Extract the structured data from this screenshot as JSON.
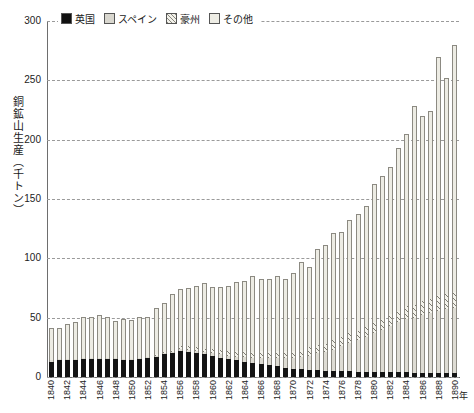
{
  "legend": {
    "items": [
      {
        "label": "英国",
        "key": "uk",
        "color": "#141414"
      },
      {
        "label": "スペイン",
        "key": "spain",
        "color": "#dedcd4"
      },
      {
        "label": "豪州",
        "key": "aus",
        "color": "#f4f3ec"
      },
      {
        "label": "その他",
        "key": "other",
        "color": "#edece4"
      }
    ]
  },
  "axes": {
    "y_title": "銅鉱山生産（千トン）",
    "y_ticks": [
      "0",
      "50",
      "100",
      "150",
      "200",
      "250",
      "300"
    ],
    "x_unit": "年",
    "x_tick_labels": [
      "1840",
      "1842",
      "1844",
      "1846",
      "1848",
      "1850",
      "1852",
      "1854",
      "1856",
      "1858",
      "1860",
      "1862",
      "1864",
      "1866",
      "1868",
      "1870",
      "1872",
      "1874",
      "1876",
      "1878",
      "1880",
      "1882",
      "1884",
      "1886",
      "1888",
      "1890"
    ]
  },
  "chart_data": {
    "type": "bar",
    "stacked": true,
    "title": "",
    "xlabel": "年",
    "ylabel": "銅鉱山生産（千トン）",
    "ylim": [
      0,
      300
    ],
    "ytick_step": 50,
    "grid": true,
    "legend_position": "top",
    "categories": [
      1840,
      1841,
      1842,
      1843,
      1844,
      1845,
      1846,
      1847,
      1848,
      1849,
      1850,
      1851,
      1852,
      1853,
      1854,
      1855,
      1856,
      1857,
      1858,
      1859,
      1860,
      1861,
      1862,
      1863,
      1864,
      1865,
      1866,
      1867,
      1868,
      1869,
      1870,
      1871,
      1872,
      1873,
      1874,
      1875,
      1876,
      1877,
      1878,
      1879,
      1880,
      1881,
      1882,
      1883,
      1884,
      1885,
      1886,
      1887,
      1888,
      1889,
      1890
    ],
    "series": [
      {
        "name": "英国",
        "key": "uk",
        "values": [
          13,
          14,
          14,
          14,
          15,
          15,
          15,
          15,
          15,
          14,
          14,
          15,
          16,
          17,
          19,
          20,
          22,
          21,
          20,
          19,
          18,
          16,
          15,
          14,
          13,
          12,
          11,
          10,
          9,
          8,
          7,
          7,
          6,
          6,
          5,
          5,
          5,
          5,
          4,
          4,
          4,
          4,
          4,
          4,
          4,
          3,
          3,
          3,
          3,
          3,
          3
        ]
      },
      {
        "name": "スペイン",
        "key": "spain",
        "values": [
          1,
          1,
          1,
          1,
          1,
          1,
          1,
          1,
          1,
          1,
          1,
          1,
          1,
          1,
          1,
          1,
          2,
          2,
          2,
          2,
          2,
          3,
          3,
          3,
          4,
          4,
          5,
          6,
          7,
          8,
          9,
          10,
          12,
          14,
          16,
          18,
          21,
          24,
          27,
          30,
          33,
          36,
          39,
          42,
          45,
          47,
          49,
          51,
          53,
          54,
          55
        ]
      },
      {
        "name": "豪州",
        "key": "aus",
        "values": [
          0,
          0,
          0,
          0,
          0,
          0,
          0,
          0,
          0,
          0,
          0,
          0,
          0,
          1,
          1,
          2,
          2,
          3,
          3,
          3,
          4,
          4,
          4,
          5,
          5,
          5,
          6,
          6,
          6,
          6,
          6,
          6,
          7,
          7,
          7,
          8,
          8,
          8,
          8,
          8,
          9,
          9,
          10,
          10,
          11,
          11,
          12,
          12,
          13,
          13,
          14
        ]
      },
      {
        "name": "その他",
        "key": "other",
        "values": [
          27,
          26,
          30,
          31,
          35,
          35,
          36,
          35,
          31,
          34,
          33,
          35,
          34,
          39,
          41,
          47,
          48,
          49,
          52,
          55,
          52,
          53,
          55,
          58,
          59,
          64,
          61,
          61,
          63,
          61,
          66,
          74,
          68,
          81,
          83,
          90,
          88,
          95,
          98,
          102,
          117,
          120,
          124,
          137,
          145,
          167,
          156,
          158,
          201,
          182,
          208
        ]
      }
    ],
    "totals": [
      41,
      41,
      45,
      46,
      51,
      51,
      52,
      51,
      47,
      49,
      48,
      51,
      51,
      58,
      62,
      70,
      74,
      75,
      77,
      79,
      76,
      76,
      77,
      80,
      81,
      85,
      83,
      83,
      85,
      83,
      88,
      97,
      93,
      108,
      111,
      121,
      122,
      132,
      137,
      144,
      163,
      169,
      177,
      193,
      205,
      228,
      220,
      224,
      270,
      252,
      280
    ]
  }
}
